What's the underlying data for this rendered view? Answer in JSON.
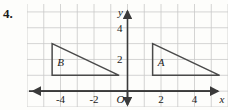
{
  "problem": {
    "number": "4."
  },
  "chart_data": {
    "type": "scatter",
    "title": "",
    "xlabel": "x",
    "ylabel": "y",
    "xlim": [
      -6,
      6
    ],
    "ylim": [
      -1,
      5.5
    ],
    "grid": true,
    "grid_step": 1,
    "legend": "none",
    "origin_label": "O",
    "x_tick_labels": [
      "-4",
      "-2",
      "2",
      "4"
    ],
    "x_tick_values": [
      -4,
      -2,
      2,
      4
    ],
    "y_tick_labels": [
      "2",
      "4"
    ],
    "y_tick_values": [
      2,
      4
    ],
    "shapes": [
      {
        "name": "B",
        "type": "triangle",
        "label": "B",
        "label_point": [
          -4.0,
          1.6
        ],
        "vertices": [
          [
            -4.5,
            3.0
          ],
          [
            -4.5,
            1.0
          ],
          [
            -0.5,
            1.0
          ]
        ]
      },
      {
        "name": "A",
        "type": "triangle",
        "label": "A",
        "label_point": [
          2.0,
          1.6
        ],
        "vertices": [
          [
            1.5,
            3.0
          ],
          [
            1.5,
            1.0
          ],
          [
            5.5,
            1.0
          ]
        ]
      }
    ]
  },
  "colors": {
    "grid_line": "#c9c9c9",
    "axis_line": "#3a3a3a",
    "shape_stroke": "#4a4a4a",
    "text": "#1a1a1a",
    "background": "#fdfdfb"
  }
}
